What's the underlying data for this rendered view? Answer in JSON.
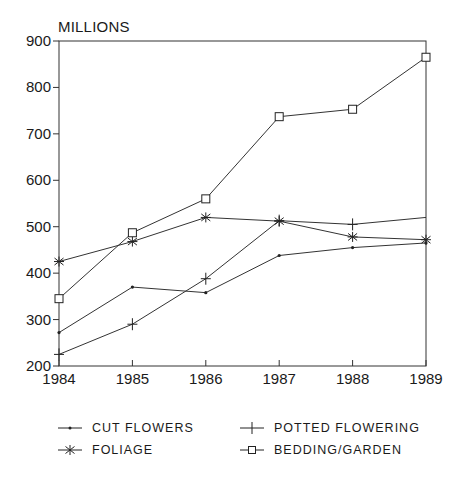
{
  "chart_data": {
    "type": "line",
    "title": "",
    "xlabel": "",
    "ylabel": "MILLIONS",
    "x": [
      1984,
      1985,
      1986,
      1987,
      1988,
      1989
    ],
    "categories": [
      "1984",
      "1985",
      "1986",
      "1987",
      "1988",
      "1989"
    ],
    "ylim": [
      200,
      900
    ],
    "yticks": [
      200,
      300,
      400,
      500,
      600,
      700,
      800,
      900
    ],
    "grid": false,
    "legend_position": "bottom",
    "series": [
      {
        "name": "CUT FLOWERS",
        "marker": "dot",
        "values": [
          272,
          370,
          358,
          438,
          455,
          465
        ]
      },
      {
        "name": "POTTED FLOWERING",
        "marker": "plus",
        "values": [
          225,
          290,
          388,
          513,
          505,
          520
        ]
      },
      {
        "name": "FOLIAGE",
        "marker": "asterisk",
        "values": [
          425,
          468,
          520,
          512,
          478,
          472
        ]
      },
      {
        "name": "BEDDING/GARDEN",
        "marker": "square",
        "values": [
          345,
          487,
          560,
          737,
          753,
          865
        ]
      }
    ]
  },
  "legend": {
    "items": [
      {
        "label": "CUT FLOWERS"
      },
      {
        "label": "POTTED FLOWERING"
      },
      {
        "label": "FOLIAGE"
      },
      {
        "label": "BEDDING/GARDEN"
      }
    ]
  }
}
